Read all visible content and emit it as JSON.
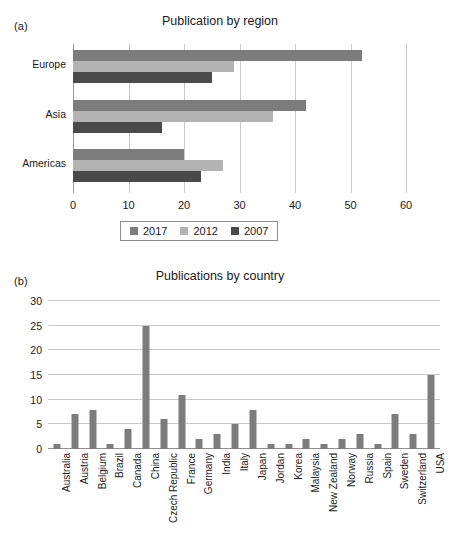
{
  "figure": {
    "background": "#ffffff",
    "panels": [
      {
        "tag": "(a)"
      },
      {
        "tag": "(b)"
      }
    ],
    "caption_fragment": ""
  },
  "colors": {
    "series_2017": "#7c7c7c",
    "series_2012": "#b3b3b3",
    "series_2007": "#4a4a4a",
    "country_bar": "#7c7c7c",
    "gridline": "#c9c9c9",
    "axis": "#8f8f8f",
    "text": "#1a1a1a"
  },
  "panel_a": {
    "tag": "(a)",
    "legend": {
      "position": "below-axis",
      "entries": [
        {
          "label": "2017",
          "color": "#7c7c7c"
        },
        {
          "label": "2012",
          "color": "#b3b3b3"
        },
        {
          "label": "2007",
          "color": "#4a4a4a"
        }
      ]
    }
  },
  "panel_b": {
    "tag": "(b)"
  },
  "chart_data": [
    {
      "type": "bar",
      "orientation": "horizontal",
      "title": "Publication by region",
      "xlabel": "",
      "ylabel": "",
      "categories": [
        "Europe",
        "Asia",
        "Americas"
      ],
      "series": [
        {
          "name": "2017",
          "color": "#7c7c7c",
          "values": [
            52,
            42,
            20
          ]
        },
        {
          "name": "2012",
          "color": "#b3b3b3",
          "values": [
            29,
            36,
            27
          ]
        },
        {
          "name": "2007",
          "color": "#4a4a4a",
          "values": [
            25,
            16,
            23
          ]
        }
      ],
      "xlim": [
        0,
        60
      ],
      "xticks": [
        0,
        10,
        20,
        30,
        40,
        50,
        60
      ],
      "grid": "vertical",
      "legend_position": "bottom"
    },
    {
      "type": "bar",
      "orientation": "vertical",
      "title": "Publications by country",
      "xlabel": "",
      "ylabel": "",
      "categories": [
        "Australia",
        "Austria",
        "Belgium",
        "Brazil",
        "Canada",
        "China",
        "Czech Republic",
        "France",
        "Germany",
        "India",
        "Italy",
        "Japan",
        "Jordan",
        "Korea",
        "Malaysia",
        "New Zealand",
        "Norway",
        "Russia",
        "Spain",
        "Sweden",
        "Switzerland",
        "USA"
      ],
      "values": [
        1,
        7,
        8,
        1,
        4,
        25,
        6,
        11,
        2,
        3,
        5,
        8,
        1,
        1,
        2,
        1,
        2,
        3,
        1,
        7,
        3,
        15
      ],
      "ylim": [
        0,
        30
      ],
      "yticks": [
        0,
        5,
        10,
        15,
        20,
        25,
        30
      ],
      "grid": "horizontal",
      "bar_color": "#7c7c7c",
      "legend_position": "none"
    }
  ]
}
